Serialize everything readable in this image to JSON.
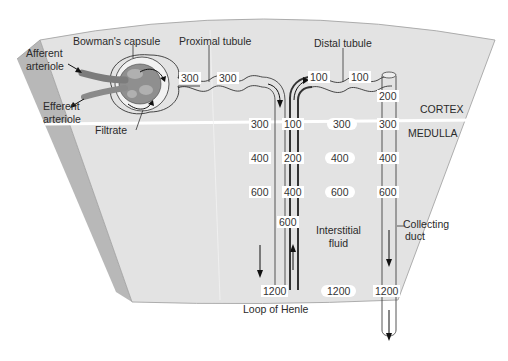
{
  "labels": {
    "afferent": "Afferent arteriole",
    "afferent_l1": "Afferent",
    "afferent_l2": "arteriole",
    "efferent_l1": "Efferent",
    "efferent_l2": "arteriole",
    "bowmans": "Bowman's capsule",
    "proximal": "Proximal tubule",
    "distal": "Distal tubule",
    "filtrate": "Filtrate",
    "cortex": "CORTEX",
    "medulla": "MEDULLA",
    "interstitial_l1": "Interstitial",
    "interstitial_l2": "fluid",
    "collecting_l1": "Collecting",
    "collecting_l2": "duct",
    "loop": "Loop of Henle"
  },
  "values": {
    "proximal": [
      "300",
      "300"
    ],
    "distal": [
      "100",
      "100"
    ],
    "descending_limb": [
      "300",
      "400",
      "600",
      "1200"
    ],
    "ascending_limb": [
      "100",
      "200",
      "400",
      "600"
    ],
    "interstitial": [
      "300",
      "400",
      "600",
      "1200"
    ],
    "collecting_duct": [
      "200",
      "300",
      "400",
      "600",
      "1200"
    ]
  },
  "colors": {
    "tissue": "#e2e2e2",
    "tissue_edge": "#b5b5b5",
    "boundary_line": "#ffffff",
    "vessel": "#8a8a8a",
    "glomerulus": "#9a9a9a",
    "stroke": "#333333"
  }
}
